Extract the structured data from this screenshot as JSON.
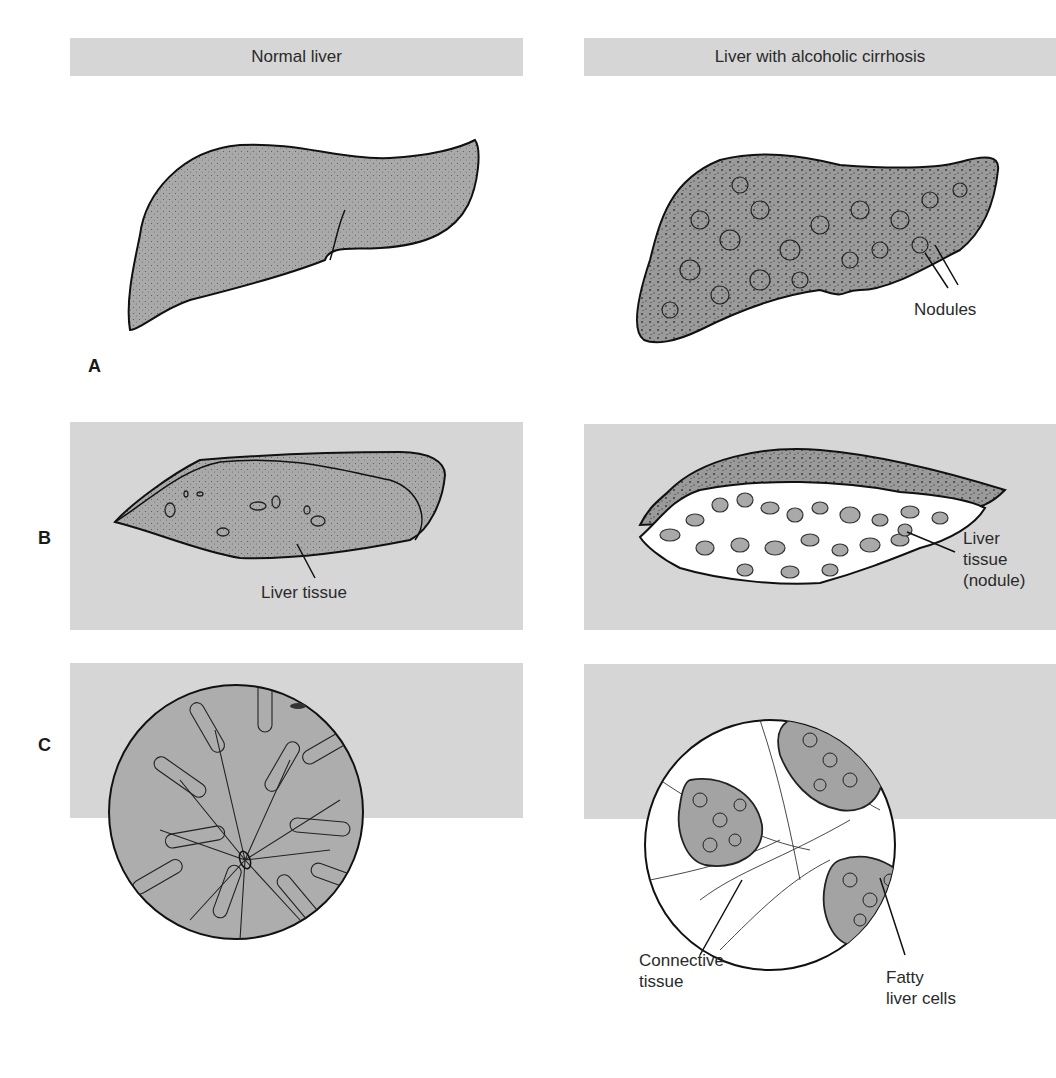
{
  "headers": {
    "left": "Normal liver",
    "right": "Liver with alcoholic cirrhosis"
  },
  "rows": [
    {
      "letter": "A"
    },
    {
      "letter": "B"
    },
    {
      "letter": "C"
    }
  ],
  "labels": {
    "nodules": "Nodules",
    "liver_tissue": "Liver tissue",
    "liver_tissue_nodule": [
      "Liver",
      "tissue",
      "(nodule)"
    ],
    "connective_tissue": [
      "Connective",
      "tissue"
    ],
    "fatty_liver_cells": [
      "Fatty",
      "liver cells"
    ]
  },
  "colors": {
    "band": "#d6d6d6",
    "tissue": "#a9a9a9",
    "outline": "#111111",
    "fibrous": "#ffffff"
  }
}
